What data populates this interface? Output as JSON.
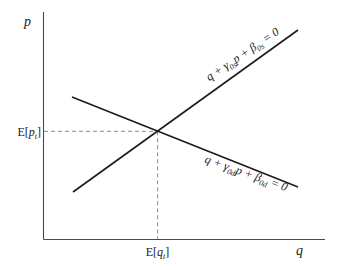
{
  "figure": {
    "background": "#ffffff",
    "curve_color": "#1b1b1b",
    "axis_color": "#4a4a4a",
    "dash_color": "#8a8a8a"
  },
  "axis_labels": {
    "y": "p",
    "x": "q"
  },
  "expected_price_label": [
    "E[",
    "p",
    "t",
    "]"
  ],
  "expected_quantity_label": [
    "E[",
    "q",
    "t",
    "]"
  ],
  "supply_equation": [
    "q + γ",
    "0s",
    "p + β",
    "0s",
    " = 0"
  ],
  "demand_equation": [
    "q + γ",
    "0d",
    "p + β",
    "0d",
    " = 0"
  ]
}
